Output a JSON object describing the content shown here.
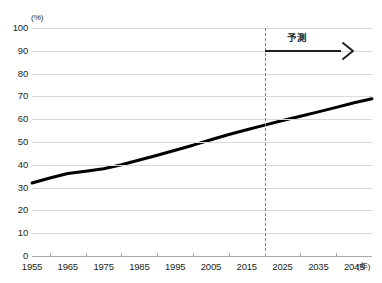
{
  "chart_data": {
    "type": "line",
    "title": "",
    "xlabel": "(年)",
    "ylabel": "(%)",
    "xlim": [
      1955,
      2050
    ],
    "ylim": [
      0,
      100
    ],
    "grid": true,
    "legend": "none",
    "x_unit_label": "(年)",
    "y_unit_label": "(%)",
    "x_tick_labels": [
      "1955",
      "1965",
      "1975",
      "1985",
      "1995",
      "2005",
      "2015",
      "2025",
      "2035",
      "2045"
    ],
    "x_tick_values": [
      1955,
      1965,
      1975,
      1985,
      1995,
      2005,
      2015,
      2025,
      2035,
      2045
    ],
    "y_tick_labels": [
      "0",
      "10",
      "20",
      "30",
      "40",
      "50",
      "60",
      "70",
      "80",
      "90",
      "100"
    ],
    "y_tick_values": [
      0,
      10,
      20,
      30,
      40,
      50,
      60,
      70,
      80,
      90,
      100
    ],
    "series": [
      {
        "name": "rate",
        "color": "#000000",
        "x": [
          1955,
          1960,
          1965,
          1970,
          1975,
          1980,
          1985,
          1990,
          1995,
          2000,
          2005,
          2010,
          2015,
          2020,
          2025,
          2030,
          2035,
          2040,
          2045,
          2050
        ],
        "values": [
          32.0,
          34.2,
          36.2,
          37.2,
          38.3,
          40.0,
          42.1,
          44.2,
          46.4,
          48.6,
          51.0,
          53.3,
          55.4,
          57.4,
          59.4,
          61.3,
          63.2,
          65.2,
          67.2,
          69.0
        ]
      }
    ],
    "annotations": [
      {
        "name": "forecast-divider",
        "type": "vline",
        "x": 2020,
        "style": "dashed",
        "color": "#808080"
      },
      {
        "name": "forecast-arrow",
        "type": "arrow",
        "label": "予測",
        "x_start": 2020,
        "x_end": 2042,
        "y": 95,
        "color": "#231f20"
      }
    ]
  },
  "annotation_text": {
    "forecast": "予測"
  }
}
